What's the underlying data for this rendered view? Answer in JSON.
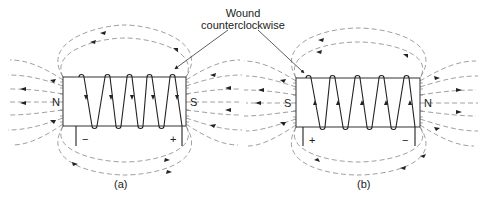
{
  "callout": {
    "line1": "Wound",
    "line2": "counterclockwise"
  },
  "diagrams": [
    {
      "caption": "(a)",
      "left_pole": "N",
      "right_pole": "S",
      "left_terminal": "−",
      "right_terminal": "+",
      "current_direction": "down",
      "field_arrow_direction": "right-to-left (S to N inside, loops outside)"
    },
    {
      "caption": "(b)",
      "left_pole": "S",
      "right_pole": "N",
      "left_terminal": "+",
      "right_terminal": "−",
      "current_direction": "up",
      "field_arrow_direction": "left-to-right"
    }
  ],
  "colors": {
    "line": "#333333",
    "field": "#777777",
    "background": "#ffffff"
  }
}
